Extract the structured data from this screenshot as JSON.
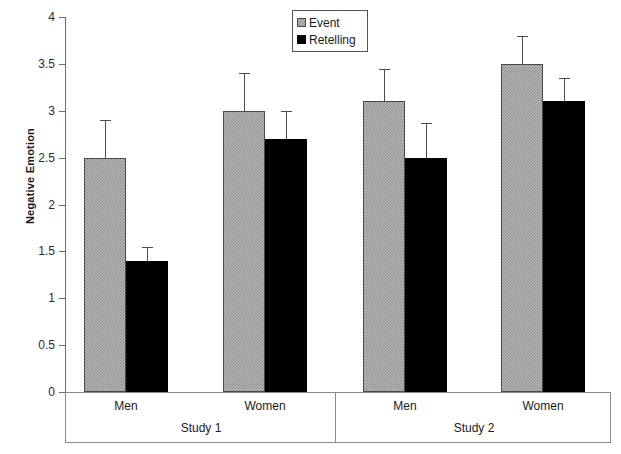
{
  "chart_data": {
    "type": "bar",
    "title": "",
    "xlabel": "",
    "ylabel": "Negative Emotion",
    "ylim": [
      0,
      4
    ],
    "yticks": [
      "0",
      "0.5",
      "1",
      "1.5",
      "2",
      "2.5",
      "3",
      "3.5",
      "4"
    ],
    "ytick_values": [
      0,
      0.5,
      1,
      1.5,
      2,
      2.5,
      3,
      3.5,
      4
    ],
    "grid": false,
    "legend_position": "top-center",
    "categories": [
      "Men",
      "Women",
      "Men",
      "Women"
    ],
    "groups": [
      {
        "name": "Study 1",
        "categories": [
          "Men",
          "Women"
        ]
      },
      {
        "name": "Study 2",
        "categories": [
          "Men",
          "Women"
        ]
      }
    ],
    "series": [
      {
        "name": "Event",
        "color": "#b5b5b5",
        "values": [
          2.5,
          3.0,
          3.1,
          3.5
        ],
        "errors": [
          0.4,
          0.4,
          0.35,
          0.3
        ]
      },
      {
        "name": "Retelling",
        "color": "#000000",
        "values": [
          1.4,
          2.7,
          2.5,
          3.1
        ],
        "errors": [
          0.15,
          0.3,
          0.37,
          0.25
        ]
      }
    ],
    "bars": [
      {
        "group": "Study 1",
        "category": "Men",
        "series": "Event",
        "value": 2.5,
        "error": 0.4,
        "x": 83,
        "width": 42
      },
      {
        "group": "Study 1",
        "category": "Men",
        "series": "Retelling",
        "value": 1.4,
        "error": 0.15,
        "x": 125,
        "width": 42
      },
      {
        "group": "Study 1",
        "category": "Women",
        "series": "Event",
        "value": 3.0,
        "error": 0.4,
        "x": 222,
        "width": 42
      },
      {
        "group": "Study 1",
        "category": "Women",
        "series": "Retelling",
        "value": 2.7,
        "error": 0.3,
        "x": 264,
        "width": 42
      },
      {
        "group": "Study 2",
        "category": "Men",
        "series": "Event",
        "value": 3.1,
        "error": 0.35,
        "x": 362,
        "width": 42
      },
      {
        "group": "Study 2",
        "category": "Men",
        "series": "Retelling",
        "value": 2.5,
        "error": 0.37,
        "x": 404,
        "width": 42
      },
      {
        "group": "Study 2",
        "category": "Women",
        "series": "Event",
        "value": 3.5,
        "error": 0.3,
        "x": 500,
        "width": 42
      },
      {
        "group": "Study 2",
        "category": "Women",
        "series": "Retelling",
        "value": 3.1,
        "error": 0.25,
        "x": 542,
        "width": 42
      }
    ]
  },
  "axis": {
    "y_title": "Negative Emotion"
  },
  "legend": {
    "items": [
      {
        "label": "Event",
        "swatch": "event-swatch"
      },
      {
        "label": "Retelling",
        "swatch": "retelling-swatch"
      }
    ]
  },
  "category_labels": [
    {
      "text": "Men",
      "center": 125
    },
    {
      "text": "Women",
      "center": 264
    },
    {
      "text": "Men",
      "center": 404
    },
    {
      "text": "Women",
      "center": 542
    }
  ],
  "study_labels": [
    {
      "text": "Study 1",
      "center": 200
    },
    {
      "text": "Study 2",
      "center": 473
    }
  ],
  "dividers": [
    {
      "x": 334
    }
  ],
  "colors": {
    "event_fill": "#b5b5b5",
    "event_hatch": "#8f8f8f",
    "retelling_fill": "#000000",
    "axis": "#6b6b6b",
    "frame": "#8a8a8a",
    "text": "#1a1a1a"
  }
}
